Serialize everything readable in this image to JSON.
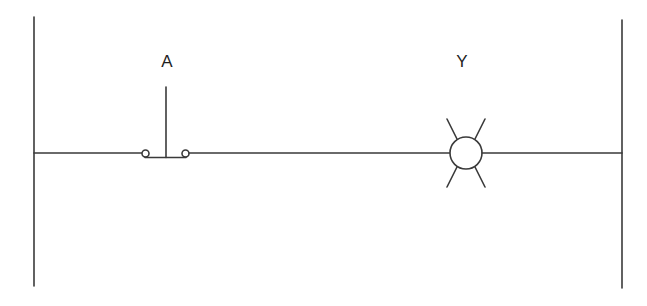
{
  "diagram": {
    "type": "ladder-logic",
    "colors": {
      "line": "#3a3a3a",
      "background": "#ffffff",
      "text": "#1f1f1f"
    },
    "rails": {
      "left": {
        "x": 34,
        "y1": 17,
        "y2": 286
      },
      "right": {
        "x": 622,
        "y1": 20,
        "y2": 288
      }
    },
    "rung": {
      "y": 153
    },
    "components": [
      {
        "id": "A",
        "label": "A",
        "kind": "normally-open pushbutton",
        "label_pos": {
          "x": 167,
          "y": 61
        }
      },
      {
        "id": "Y",
        "label": "Y",
        "kind": "lamp (indicator light)",
        "label_pos": {
          "x": 462,
          "y": 61
        }
      }
    ]
  }
}
